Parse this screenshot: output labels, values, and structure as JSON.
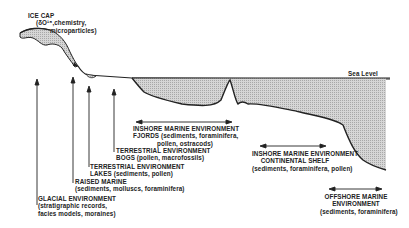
{
  "diagram": {
    "sea_level_label": "Sea Level",
    "colors": {
      "ink": "#222222",
      "fill": "#c8c8c8",
      "background": "#ffffff"
    },
    "labels": {
      "ice_cap": {
        "title": "ICE CAP",
        "line2": "(δO¹⁸,chemistry,",
        "line3": "microparticles)"
      },
      "glacial": {
        "title": "GLACIAL ENVIRONMENT",
        "line2": "(stratigraphic records,",
        "line3": "facies models, moraines)"
      },
      "raised_marine": {
        "title": "RAISED MARINE",
        "line2": "(sediments, molluscs, foraminifera)"
      },
      "terrestrial_lakes": {
        "title": "TERRESTRIAL ENVIRONMENT",
        "line2": "LAKES (sediments, pollen)"
      },
      "terrestrial_bogs": {
        "title": "TERRESTRIAL ENVIRONMENT",
        "line2": "BOGS (pollen, macrofossils)"
      },
      "inshore_fjords": {
        "title": "INSHORE MARINE ENVIRONMENT",
        "line2": "FJORDS (sediments, foraminifera,",
        "line3": "pollen, ostracods)"
      },
      "inshore_shelf": {
        "title": "INSHORE MARINE ENVIRONMENT",
        "line2": "CONTINENTAL SHELF",
        "line3": "(sediments, foraminifera, pollen)"
      },
      "offshore": {
        "title": "OFFSHORE MARINE",
        "line2": "ENVIRONMENT",
        "line3": "(sediments, foraminifera)"
      }
    }
  }
}
